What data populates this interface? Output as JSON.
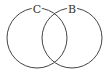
{
  "diagram": {
    "type": "venn",
    "sets": [
      {
        "label": "C",
        "cx": 37,
        "cy": 38,
        "r": 30
      },
      {
        "label": "B",
        "cx": 72,
        "cy": 38,
        "r": 30
      }
    ],
    "stroke_color": "#444444"
  }
}
